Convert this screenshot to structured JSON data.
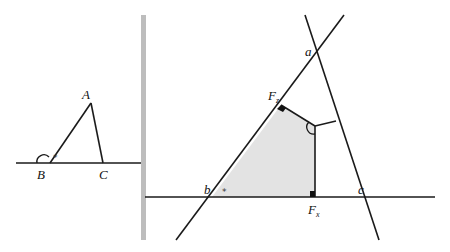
{
  "colors": {
    "line": "#1a1a1a",
    "divider": "#bdbdbd",
    "shade": "#e3e3e3",
    "background": "#ffffff"
  },
  "left_figure": {
    "labels": {
      "A": "A",
      "B": "B",
      "C": "C"
    },
    "angle_mark": "*",
    "points": {
      "A": [
        91,
        103
      ],
      "B": [
        50,
        163
      ],
      "C": [
        103,
        163
      ]
    },
    "baseline": {
      "x1": 16,
      "x2": 141,
      "y": 163
    }
  },
  "divider": {
    "x": 143,
    "y1": 15,
    "y2": 240,
    "width": 5
  },
  "right_figure": {
    "labels": {
      "a": "a",
      "b": "b",
      "c": "c",
      "Fz": "F",
      "Fz_sub": "z",
      "Fx": "F",
      "Fx_sub": "x"
    },
    "angle_mark": "*",
    "lines": {
      "ab": {
        "x1": 176,
        "y1": 240,
        "x2": 344,
        "y2": 15
      },
      "ac": {
        "x1": 305,
        "y1": 15,
        "x2": 379,
        "y2": 240
      },
      "bc": {
        "x1": 145,
        "y1": 197,
        "x2": 435,
        "y2": 197
      }
    },
    "shaded_region": [
      [
        212,
        197
      ],
      [
        281,
        105
      ],
      [
        315,
        126
      ],
      [
        315,
        197
      ]
    ],
    "perpendicular": {
      "x1": 315,
      "y1": 126,
      "x2": 336,
      "y2": 121
    }
  }
}
